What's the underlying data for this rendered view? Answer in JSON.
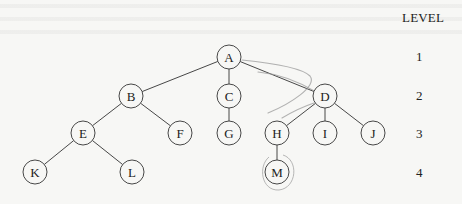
{
  "level_header": "LEVEL",
  "levels": [
    {
      "label": "1",
      "y": 57
    },
    {
      "label": "2",
      "y": 96
    },
    {
      "label": "3",
      "y": 134
    },
    {
      "label": "4",
      "y": 173
    }
  ],
  "tree": {
    "node_radius": 12,
    "nodes": [
      {
        "id": "A",
        "label": "A",
        "x": 229,
        "y": 57,
        "level": 1
      },
      {
        "id": "B",
        "label": "B",
        "x": 131,
        "y": 96,
        "level": 2
      },
      {
        "id": "C",
        "label": "C",
        "x": 229,
        "y": 96,
        "level": 2
      },
      {
        "id": "D",
        "label": "D",
        "x": 325,
        "y": 96,
        "level": 2
      },
      {
        "id": "E",
        "label": "E",
        "x": 83,
        "y": 133,
        "level": 3
      },
      {
        "id": "F",
        "label": "F",
        "x": 180,
        "y": 133,
        "level": 3
      },
      {
        "id": "G",
        "label": "G",
        "x": 229,
        "y": 133,
        "level": 3
      },
      {
        "id": "H",
        "label": "H",
        "x": 277,
        "y": 133,
        "level": 3
      },
      {
        "id": "I",
        "label": "I",
        "x": 325,
        "y": 133,
        "level": 3
      },
      {
        "id": "J",
        "label": "J",
        "x": 373,
        "y": 133,
        "level": 3
      },
      {
        "id": "K",
        "label": "K",
        "x": 35,
        "y": 172,
        "level": 4
      },
      {
        "id": "L",
        "label": "L",
        "x": 132,
        "y": 172,
        "level": 4
      },
      {
        "id": "M",
        "label": "M",
        "x": 277,
        "y": 172,
        "level": 4
      }
    ],
    "edges": [
      [
        "A",
        "B"
      ],
      [
        "A",
        "C"
      ],
      [
        "A",
        "D"
      ],
      [
        "B",
        "E"
      ],
      [
        "B",
        "F"
      ],
      [
        "C",
        "G"
      ],
      [
        "D",
        "H"
      ],
      [
        "D",
        "I"
      ],
      [
        "D",
        "J"
      ],
      [
        "E",
        "K"
      ],
      [
        "E",
        "L"
      ],
      [
        "H",
        "M"
      ]
    ]
  },
  "annotations": {
    "pencil_color": "#9a9a9a",
    "highlighted_node": "M"
  },
  "colors": {
    "background": "#f7f7f5",
    "stroke": "#333333",
    "text": "#222222"
  }
}
